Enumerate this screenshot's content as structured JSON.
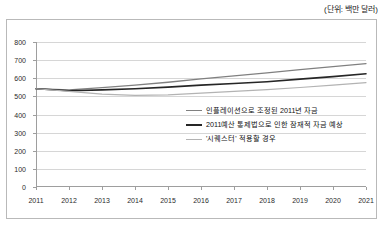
{
  "unit_note": "(단위: 백만 달러)",
  "chart_data": {
    "type": "line",
    "title": "",
    "subtitle": "",
    "xlabel": "",
    "ylabel": "",
    "unit_note": "(단위: 백만 달러)",
    "grid": true,
    "legend_position": "inside-center-right",
    "x": [
      2011,
      2012,
      2013,
      2014,
      2015,
      2016,
      2017,
      2018,
      2019,
      2020,
      2021
    ],
    "xtick_labels": [
      "2011",
      "2012",
      "2013",
      "2014",
      "2015",
      "2016",
      "2017",
      "2018",
      "2019",
      "2020",
      "2021"
    ],
    "ytick_labels": [
      "0",
      "100",
      "200",
      "300",
      "400",
      "500",
      "600",
      "700",
      "800"
    ],
    "yticks": [
      0,
      100,
      200,
      300,
      400,
      500,
      600,
      700,
      800
    ],
    "ylim": [
      0,
      800
    ],
    "xlim": [
      2011,
      2021
    ],
    "series": [
      {
        "name": "인플레이션으로 조정된 2011년 자금",
        "color": "#808080",
        "width": 1.3,
        "values": [
          542,
          536,
          548,
          562,
          578,
          596,
          613,
          630,
          648,
          664,
          681
        ]
      },
      {
        "name": "2011예산 통제법으로 인한 잠재적 자금 예상",
        "color": "#262626",
        "width": 1.6,
        "values": [
          542,
          531,
          536,
          542,
          551,
          562,
          571,
          581,
          595,
          609,
          625
        ]
      },
      {
        "name": "'시퀘스터' 적용할 경우",
        "color": "#b3b3b3",
        "width": 1.2,
        "values": [
          542,
          528,
          512,
          506,
          508,
          518,
          528,
          537,
          549,
          562,
          576
        ]
      }
    ]
  },
  "legend": [
    {
      "label": "인플레이션으로 조정된 2011년 자금",
      "color": "#808080",
      "width": 1.6
    },
    {
      "label": "2011예산 통제법으로 인한 잠재적 자금 예상",
      "color": "#262626",
      "width": 2.2
    },
    {
      "label": "'시퀘스터' 적용할 경우",
      "color": "#b3b3b3",
      "width": 1.3
    }
  ]
}
